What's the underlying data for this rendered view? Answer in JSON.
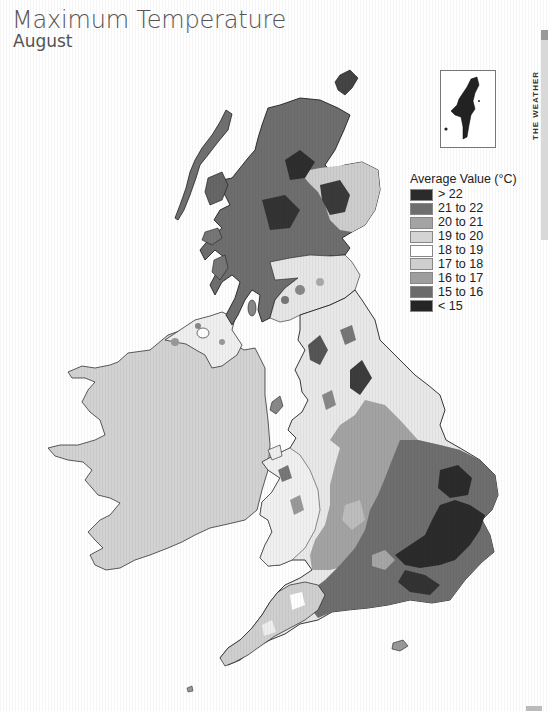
{
  "header": {
    "title": "Maximum Temperature",
    "subtitle": "August"
  },
  "side_tab": {
    "text": "THE WEATHER"
  },
  "inset": {
    "label": "Shetland inset"
  },
  "legend": {
    "title": "Average Value (°C)",
    "items": [
      {
        "label": "> 22",
        "color": "#2b2b2b"
      },
      {
        "label": "21 to 22",
        "color": "#6e6e6e"
      },
      {
        "label": "20 to 21",
        "color": "#a3a3a3"
      },
      {
        "label": "19 to 20",
        "color": "#d4d4d4"
      },
      {
        "label": "18 to 19",
        "color": "#ffffff"
      },
      {
        "label": "17 to 18",
        "color": "#cfcfcf"
      },
      {
        "label": "16 to 17",
        "color": "#9e9e9e"
      },
      {
        "label": "15 to 16",
        "color": "#6b6b6b"
      },
      {
        "label": "< 15",
        "color": "#252525"
      }
    ]
  },
  "map": {
    "regions": [
      {
        "name": "Ireland",
        "fill": "#d2d2d2"
      },
      {
        "name": "Northern Ireland",
        "fill": "#eeeeee"
      },
      {
        "name": "Scotland Highlands",
        "fill": "#6e6e6e"
      },
      {
        "name": "Scotland North-East",
        "fill": "#c8c8c8"
      },
      {
        "name": "Southern Scotland",
        "fill": "#e6e6e6"
      },
      {
        "name": "Northern England",
        "fill": "#e8e8e8"
      },
      {
        "name": "Wales",
        "fill": "#ebebeb"
      },
      {
        "name": "Midlands",
        "fill": "#a3a3a3"
      },
      {
        "name": "South-East England",
        "fill": "#6e6e6e"
      },
      {
        "name": "East Anglia / London",
        "fill": "#2b2b2b"
      },
      {
        "name": "South-West England",
        "fill": "#d0d0d0"
      }
    ]
  }
}
